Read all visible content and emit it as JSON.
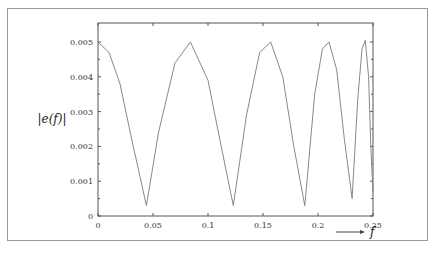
{
  "chart_data": {
    "type": "line",
    "title": "",
    "xlabel": "f",
    "ylabel": "|e(f)|",
    "xlim": [
      0,
      0.25
    ],
    "ylim": [
      0,
      0.0055
    ],
    "x_ticks": [
      "0",
      "0.05",
      "0.1",
      "0.15",
      "0.2",
      "0.25"
    ],
    "y_ticks": [
      "0",
      "0.001",
      "0.002",
      "0.003",
      "0.004",
      "0.005"
    ],
    "grid": false,
    "legend": null,
    "series": [
      {
        "name": "|e(f)|",
        "color": "#888888",
        "x": [
          0,
          0.01,
          0.02,
          0.03,
          0.044,
          0.055,
          0.07,
          0.084,
          0.1,
          0.112,
          0.123,
          0.135,
          0.147,
          0.157,
          0.168,
          0.178,
          0.188,
          0.197,
          0.204,
          0.21,
          0.217,
          0.224,
          0.231,
          0.236,
          0.24,
          0.243,
          0.246,
          0.248,
          0.25
        ],
        "values": [
          0.005,
          0.0047,
          0.0038,
          0.0023,
          0.0003,
          0.0024,
          0.0044,
          0.005,
          0.0039,
          0.002,
          0.0003,
          0.0029,
          0.0047,
          0.005,
          0.004,
          0.002,
          0.0003,
          0.0035,
          0.0048,
          0.005,
          0.0042,
          0.0022,
          0.0005,
          0.0033,
          0.0048,
          0.00505,
          0.004,
          0.002,
          0.0007
        ]
      }
    ]
  },
  "axis": {
    "ylabel": "|e(f)|",
    "xlabel": "f"
  }
}
